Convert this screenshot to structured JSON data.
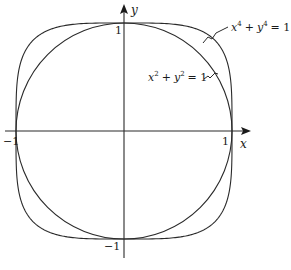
{
  "figure": {
    "axes": {
      "x_label": "x",
      "y_label": "y",
      "ticks": {
        "x_neg": "−1",
        "x_pos": "1",
        "y_pos": "1",
        "y_neg": "−1"
      }
    },
    "curves": [
      {
        "name": "superellipse",
        "equation_lhs_a": "x",
        "exp_a": "4",
        "plus": "+",
        "equation_lhs_b": "y",
        "exp_b": "4",
        "equals": "= 1",
        "exponent": 4
      },
      {
        "name": "circle",
        "equation_lhs_a": "x",
        "exp_a": "2",
        "plus": "+",
        "equation_lhs_b": "y",
        "exp_b": "2",
        "equals": "= 1",
        "exponent": 2
      }
    ],
    "colors": {
      "stroke": "#2a2a2a",
      "background": "#ffffff"
    }
  }
}
